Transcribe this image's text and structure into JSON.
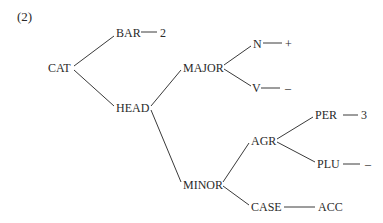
{
  "example_number": "(2)",
  "tree": {
    "root": "CAT",
    "nodes": {
      "cat": "CAT",
      "bar": "BAR",
      "bar_value": "2",
      "head": "HEAD",
      "major": "MAJOR",
      "n": "N",
      "n_value": "+",
      "v": "V",
      "v_value": "–",
      "minor": "MINOR",
      "agr": "AGR",
      "per": "PER",
      "per_value": "3",
      "plu": "PLU",
      "plu_value": "–",
      "case": "CASE",
      "case_value": "ACC"
    },
    "edges": [
      [
        "CAT",
        "BAR"
      ],
      [
        "CAT",
        "HEAD"
      ],
      [
        "BAR",
        "2"
      ],
      [
        "HEAD",
        "MAJOR"
      ],
      [
        "HEAD",
        "MINOR"
      ],
      [
        "MAJOR",
        "N"
      ],
      [
        "MAJOR",
        "V"
      ],
      [
        "N",
        "+"
      ],
      [
        "V",
        "–"
      ],
      [
        "MINOR",
        "AGR"
      ],
      [
        "MINOR",
        "CASE"
      ],
      [
        "AGR",
        "PER"
      ],
      [
        "AGR",
        "PLU"
      ],
      [
        "PER",
        "3"
      ],
      [
        "PLU",
        "–"
      ],
      [
        "CASE",
        "ACC"
      ]
    ]
  }
}
